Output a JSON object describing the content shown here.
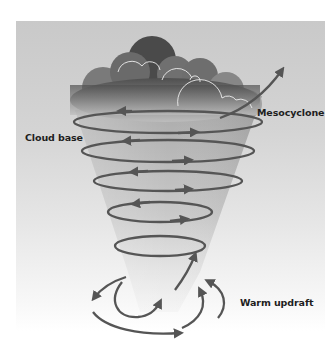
{
  "diagram": {
    "labels": {
      "cloud_base": "Cloud base",
      "mesocyclone": "Mesocyclone",
      "warm_updraft": "Warm updraft"
    },
    "colors": {
      "background_top": "#c9c9c9",
      "background_bottom": "#ffffff",
      "cloud_dark": "#5a5a5a",
      "cloud_light": "#b8b8b8",
      "cloud_outline": "#f0f0f0",
      "funnel": "#b0b0b0",
      "arrow": "#555555",
      "label_text": "#1e1e1e"
    },
    "spiral_loops": 5,
    "ground_arrows": 6
  }
}
